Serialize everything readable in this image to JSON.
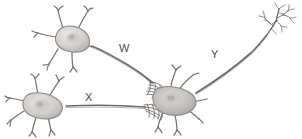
{
  "figure": {
    "background_color": "#ffffff",
    "width": 302,
    "height": 139,
    "style": "grayscale pencil illustration"
  },
  "labels": {
    "w": "W",
    "x": "X",
    "y": "Y"
  },
  "colors": {
    "background": "#ffffff",
    "line_dark": "#555555",
    "line_mid": "#7a7a7a",
    "line_light": "#9a9a9a",
    "soma_fill_light": "#e2e0de",
    "soma_fill_mid": "#c9c6c3",
    "soma_fill_dark": "#b0adaa",
    "nucleus": "#a9a6a3",
    "label_text": "#4a4a4a"
  },
  "neurons": [
    {
      "id": "neuron-top-left",
      "name": "Top-left presynaptic neuron",
      "soma_center": [
        72,
        38
      ],
      "axon_label": "W"
    },
    {
      "id": "neuron-bottom-left",
      "name": "Bottom-left presynaptic neuron",
      "soma_center": [
        42,
        105
      ],
      "axon_label": "X"
    },
    {
      "id": "neuron-center",
      "name": "Central postsynaptic neuron",
      "soma_center": [
        172,
        100
      ],
      "axon_label": "Y"
    }
  ],
  "axons": [
    {
      "id": "axon-w",
      "label": "W",
      "from": "neuron-top-left",
      "to": "neuron-center",
      "description": "Curving axon from top-left soma descending to central soma synapse"
    },
    {
      "id": "axon-x",
      "label": "X",
      "from": "neuron-bottom-left",
      "to": "neuron-center",
      "description": "Near-horizontal axon from bottom-left soma to central soma synapse"
    },
    {
      "id": "axon-y",
      "label": "Y",
      "from": "neuron-center",
      "to": "terminal-arbor-right",
      "description": "Long ascending axon from central soma to branching terminal arbor at upper right"
    }
  ],
  "terminals": [
    {
      "id": "terminal-arbor-right",
      "name": "Axon terminal arbor",
      "position": [
        278,
        25
      ]
    },
    {
      "id": "synapse-w-cluster",
      "name": "Synaptic terminal boutons from W",
      "position": [
        152,
        84
      ]
    },
    {
      "id": "synapse-x-cluster",
      "name": "Synaptic terminal boutons from X",
      "position": [
        150,
        108
      ]
    }
  ]
}
